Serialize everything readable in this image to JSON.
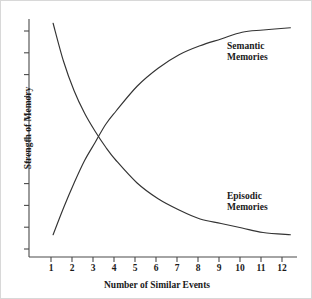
{
  "chart_data": {
    "type": "line",
    "title": "",
    "xlabel": "Number of Similar Events",
    "ylabel": "Strength of Memory",
    "x_tick_labels": [
      "1",
      "2",
      "3",
      "4",
      "5",
      "6",
      "7",
      "8",
      "9",
      "10",
      "11",
      "12"
    ],
    "y_tick_labels": [],
    "y_tick_count": 11,
    "xlim": [
      1,
      12
    ],
    "ylim": [
      0,
      100
    ],
    "grid": false,
    "legend_position": "inline-annotation",
    "line_color": "#333333",
    "axis_color": "#4a4a4a",
    "background": "#ffffff",
    "series": [
      {
        "name": "Semantic Memories",
        "label_lines": [
          "Semantic",
          "Memories"
        ],
        "x": [
          1.1,
          1.6,
          2.1,
          2.6,
          3.1,
          3.6,
          4.1,
          5.1,
          6.1,
          7.1,
          8.1,
          9.1,
          10.1,
          11.1,
          12.4
        ],
        "values": [
          5,
          17,
          28,
          38,
          46,
          54,
          60,
          71,
          79,
          85,
          89,
          92,
          95,
          96,
          97
        ]
      },
      {
        "name": "Episodic Memories",
        "label_lines": [
          "Episodic",
          "Memories"
        ],
        "x": [
          1.1,
          1.6,
          2.1,
          2.6,
          3.1,
          3.6,
          4.1,
          5.1,
          6.1,
          7.1,
          8.1,
          9.1,
          10.1,
          11.1,
          12.4
        ],
        "values": [
          99,
          82,
          69,
          59,
          51,
          44,
          38,
          28,
          21,
          16,
          12,
          10,
          8,
          6,
          5
        ]
      }
    ],
    "crossing_point": {
      "x": 3.5,
      "y": 52
    }
  }
}
